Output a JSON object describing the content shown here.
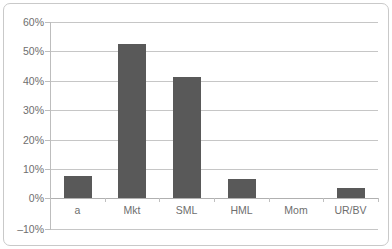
{
  "chart_data": {
    "type": "bar",
    "title": "",
    "xlabel": "",
    "ylabel": "",
    "categories": [
      "a",
      "Mkt",
      "SML",
      "HML",
      "Mom",
      "UR/BV"
    ],
    "values": [
      7.5,
      52.0,
      41.0,
      6.5,
      0.0,
      3.5
    ],
    "value_suffix": "%",
    "ylim": [
      -10,
      60
    ],
    "ytick_values": [
      60,
      50,
      40,
      30,
      20,
      10,
      0,
      -10
    ],
    "ytick_labels": [
      "60%",
      "50%",
      "40%",
      "30%",
      "20%",
      "10%",
      "0%",
      "–10%"
    ],
    "grid": true,
    "legend": false,
    "bar_color": "#595959",
    "gridline_color": "#c6c6c6",
    "axis_color": "#bdbdbd",
    "label_color": "#6e6e6e",
    "frame_color": "#c9c9c9",
    "background_color": "#ffffff"
  }
}
